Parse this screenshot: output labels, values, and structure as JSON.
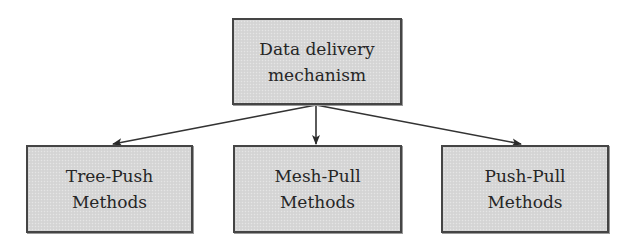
{
  "diagram": {
    "type": "tree",
    "colors": {
      "node_fill": "#d7d7d7",
      "node_border": "#454545",
      "edge": "#333333",
      "text": "#262626",
      "background": "#ffffff"
    },
    "root": {
      "id": "data-delivery-mechanism",
      "lines": [
        "Data delivery",
        "mechanism"
      ]
    },
    "children": [
      {
        "id": "tree-push-methods",
        "lines": [
          "Tree-Push",
          "Methods"
        ]
      },
      {
        "id": "mesh-pull-methods",
        "lines": [
          "Mesh-Pull",
          "Methods"
        ]
      },
      {
        "id": "push-pull-methods",
        "lines": [
          "Push-Pull",
          "Methods"
        ]
      }
    ],
    "edges": [
      {
        "from": "data-delivery-mechanism",
        "to": "tree-push-methods",
        "style": "arrow"
      },
      {
        "from": "data-delivery-mechanism",
        "to": "mesh-pull-methods",
        "style": "arrow"
      },
      {
        "from": "data-delivery-mechanism",
        "to": "push-pull-methods",
        "style": "arrow"
      }
    ]
  }
}
